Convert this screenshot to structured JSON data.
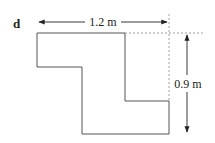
{
  "figure": {
    "label": "d",
    "width_dimension": "1.2 m",
    "height_dimension": "0.9 m"
  },
  "colors": {
    "outline": "#555555",
    "arrow": "#222222",
    "dashed": "#888888",
    "text": "#222222"
  }
}
